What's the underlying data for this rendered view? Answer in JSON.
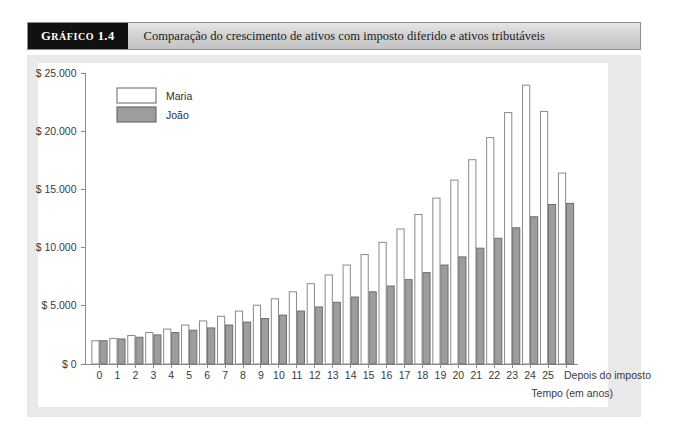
{
  "caption": {
    "tag_prefix": "G",
    "tag_rest": "RÁFICO",
    "tag_number": "1.4",
    "text": "Comparação do crescimento de ativos com imposto diferido e ativos tributáveis"
  },
  "chart_data": {
    "type": "bar",
    "title": "Comparação do crescimento de ativos com imposto diferido e ativos tributáveis",
    "xlabel": "Tempo (em anos)",
    "ylabel": "",
    "ylim": [
      0,
      25000
    ],
    "grid": false,
    "legend_position": "top-left",
    "ytick_labels": [
      "$ 0",
      "$ 5.000",
      "$ 10.000",
      "$ 15.000",
      "$ 20.000",
      "$ 25.000"
    ],
    "ytick_values": [
      0,
      5000,
      10000,
      15000,
      20000,
      25000
    ],
    "categories": [
      "0",
      "1",
      "2",
      "3",
      "4",
      "5",
      "6",
      "7",
      "8",
      "9",
      "10",
      "11",
      "12",
      "13",
      "14",
      "15",
      "16",
      "17",
      "18",
      "19",
      "20",
      "21",
      "22",
      "23",
      "24",
      "25",
      "Depois do imposto"
    ],
    "series": [
      {
        "name": "Maria",
        "color": "#ffffff",
        "values": [
          2000,
          2200,
          2450,
          2700,
          3000,
          3350,
          3700,
          4100,
          4550,
          5050,
          5600,
          6200,
          6900,
          7650,
          8500,
          9400,
          10450,
          11600,
          12850,
          14250,
          15800,
          17550,
          19450,
          21600,
          23950,
          26600,
          16400
        ]
      },
      {
        "name": "João",
        "color": "#9d9d9d",
        "values": [
          2000,
          2150,
          2300,
          2500,
          2700,
          2900,
          3100,
          3350,
          3600,
          3900,
          4200,
          4550,
          4900,
          5300,
          5750,
          6200,
          6700,
          7250,
          7850,
          8500,
          9200,
          9950,
          10800,
          11700,
          12650,
          13700,
          13800
        ]
      }
    ],
    "displayed_series": [
      {
        "name": "Maria",
        "values": [
          2000,
          2200,
          2450,
          2700,
          3000,
          3350,
          3700,
          4100,
          4550,
          5050,
          5600,
          6200,
          6900,
          7650,
          8500,
          9400,
          10450,
          11600,
          12850,
          14250,
          15800,
          17550,
          19450,
          21600,
          23950,
          21700,
          16400
        ]
      },
      {
        "name": "João",
        "values": [
          2000,
          2150,
          2300,
          2500,
          2700,
          2900,
          3100,
          3350,
          3600,
          3900,
          4200,
          4550,
          4900,
          5300,
          5750,
          6200,
          6700,
          7250,
          7850,
          8500,
          9200,
          9950,
          10800,
          11700,
          12650,
          13700,
          13800
        ]
      }
    ]
  }
}
